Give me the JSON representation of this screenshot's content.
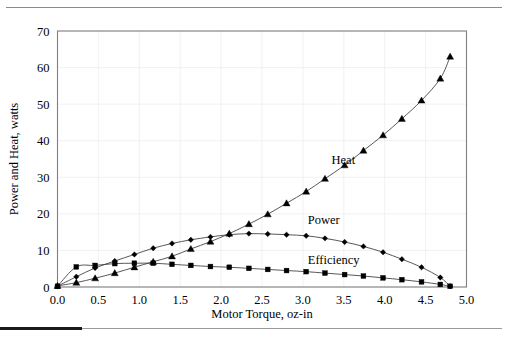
{
  "figure": {
    "background": "#ffffff",
    "frame_color": "#808080",
    "grid_color": "#ededed",
    "series_color": "#000000"
  },
  "chart_data": {
    "type": "line",
    "title": "",
    "xlabel": "Motor Torque, oz-in",
    "ylabel": "Power and Heat, watts",
    "xlim": [
      0.0,
      5.0
    ],
    "ylim": [
      0,
      70
    ],
    "xticks": [
      "0.0",
      "0.5",
      "1.0",
      "1.5",
      "2.0",
      "2.5",
      "3.0",
      "3.5",
      "4.0",
      "4.5",
      "5.0"
    ],
    "yticks": [
      "0",
      "10",
      "20",
      "30",
      "40",
      "50",
      "60",
      "70"
    ],
    "xtick_values": [
      0.0,
      0.5,
      1.0,
      1.5,
      2.0,
      2.5,
      3.0,
      3.5,
      4.0,
      4.5,
      5.0
    ],
    "ytick_values": [
      0,
      10,
      20,
      30,
      40,
      50,
      60,
      70
    ],
    "grid": true,
    "legend": "inline-annotations",
    "series": [
      {
        "name": "Heat",
        "marker": "triangle",
        "label_x": 3.35,
        "label_y": 33.5,
        "x": [
          0.0,
          0.23,
          0.46,
          0.7,
          0.94,
          1.17,
          1.4,
          1.63,
          1.87,
          2.1,
          2.34,
          2.57,
          2.8,
          3.04,
          3.27,
          3.51,
          3.74,
          3.98,
          4.21,
          4.45,
          4.68,
          4.8
        ],
        "y": [
          0.3,
          1.2,
          2.4,
          3.8,
          5.4,
          6.9,
          8.4,
          10.4,
          12.4,
          14.6,
          17.2,
          19.9,
          22.9,
          26.1,
          29.6,
          33.3,
          37.3,
          41.5,
          46.0,
          51.0,
          57.0,
          63.0
        ]
      },
      {
        "name": "Power",
        "marker": "diamond",
        "label_x": 3.06,
        "label_y": 17.2,
        "x": [
          0.0,
          0.23,
          0.46,
          0.7,
          0.94,
          1.17,
          1.4,
          1.63,
          1.87,
          2.1,
          2.34,
          2.57,
          2.8,
          3.04,
          3.27,
          3.51,
          3.74,
          3.98,
          4.21,
          4.45,
          4.68,
          4.8
        ],
        "y": [
          0.2,
          2.8,
          5.2,
          7.1,
          8.9,
          10.6,
          11.9,
          12.9,
          13.7,
          14.3,
          14.6,
          14.5,
          14.3,
          14.0,
          13.3,
          12.3,
          11.1,
          9.5,
          7.6,
          5.4,
          2.6,
          0.2
        ]
      },
      {
        "name": "Efficiency",
        "marker": "square",
        "label_x": 3.06,
        "label_y": 6.4,
        "x": [
          0.0,
          0.23,
          0.46,
          0.7,
          0.94,
          1.17,
          1.4,
          1.63,
          1.87,
          2.1,
          2.34,
          2.57,
          2.8,
          3.04,
          3.27,
          3.51,
          3.74,
          3.98,
          4.21,
          4.45,
          4.68,
          4.8
        ],
        "y": [
          0.2,
          5.5,
          5.9,
          6.4,
          6.5,
          6.5,
          6.2,
          5.9,
          5.6,
          5.4,
          5.1,
          4.8,
          4.5,
          4.2,
          3.8,
          3.4,
          3.0,
          2.5,
          2.0,
          1.4,
          0.7,
          0.2
        ]
      }
    ]
  }
}
